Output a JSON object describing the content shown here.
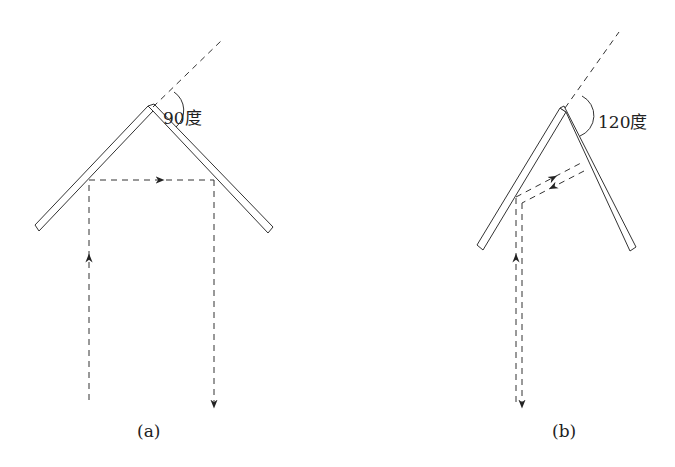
{
  "figure": {
    "panels": [
      {
        "id": "a",
        "caption": "(a)",
        "angle_label": "90度",
        "angle_degrees": 90,
        "ray_path": "incoming vertical up -> reflect left mirror -> horizontal right -> reflect right mirror -> vertical down"
      },
      {
        "id": "b",
        "caption": "(b)",
        "angle_label": "120度",
        "angle_degrees": 120,
        "ray_path": "incoming vertical up -> reflect left mirror -> slanted to right mirror -> reflected back along same path -> vertical down"
      }
    ],
    "colors": {
      "line": "#333333",
      "background": "#ffffff"
    }
  }
}
